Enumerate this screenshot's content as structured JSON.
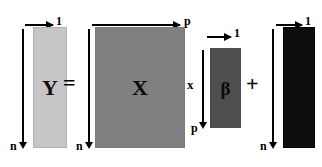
{
  "figure": {
    "background_color": "#ffffff"
  },
  "matrices": [
    {
      "id": "Y",
      "symbol": "Y",
      "color": "#c6c6c6",
      "cols_label": "1",
      "rows_label": "n"
    },
    {
      "id": "X",
      "symbol": "X",
      "color": "#808080",
      "cols_label": "p",
      "rows_label": "n"
    },
    {
      "id": "beta",
      "symbol": "β",
      "color": "#4f4f4f",
      "cols_label": "1",
      "rows_label": "p"
    },
    {
      "id": "error",
      "symbol": "",
      "color": "#0d0d0d",
      "cols_label": "1",
      "rows_label": "n"
    }
  ],
  "operators": {
    "equals": "=",
    "times": "x",
    "plus": "+"
  }
}
